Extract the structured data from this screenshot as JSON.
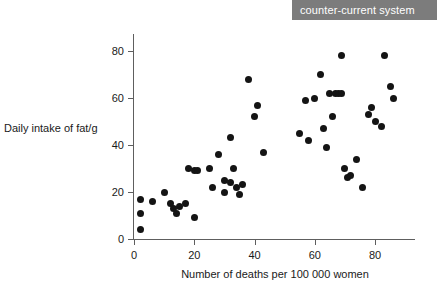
{
  "header": {
    "banner_label": "counter-current system",
    "banner_color": "#7c7c7c",
    "text_color": "#ffffff"
  },
  "chart_data": {
    "type": "scatter",
    "title": "",
    "xlabel": "Number of deaths per 100 000 women",
    "ylabel": "Daily intake of fat/g",
    "xlim": [
      0,
      90
    ],
    "ylim": [
      0,
      88
    ],
    "xticks": [
      0,
      20,
      40,
      60,
      80
    ],
    "yticks": [
      0,
      20,
      40,
      60,
      80
    ],
    "grid": false,
    "legend": null,
    "marker_color": "#141414",
    "axis_color": "#5e5e5e",
    "points": [
      {
        "x": 2,
        "y": 17
      },
      {
        "x": 2,
        "y": 11
      },
      {
        "x": 2,
        "y": 4
      },
      {
        "x": 6,
        "y": 16
      },
      {
        "x": 10,
        "y": 20
      },
      {
        "x": 12,
        "y": 15
      },
      {
        "x": 13,
        "y": 13
      },
      {
        "x": 15,
        "y": 14
      },
      {
        "x": 14,
        "y": 11
      },
      {
        "x": 17,
        "y": 15
      },
      {
        "x": 18,
        "y": 30
      },
      {
        "x": 20,
        "y": 29
      },
      {
        "x": 21,
        "y": 29
      },
      {
        "x": 20,
        "y": 9
      },
      {
        "x": 25,
        "y": 30
      },
      {
        "x": 26,
        "y": 22
      },
      {
        "x": 28,
        "y": 36
      },
      {
        "x": 30,
        "y": 25
      },
      {
        "x": 30,
        "y": 20
      },
      {
        "x": 32,
        "y": 43
      },
      {
        "x": 32,
        "y": 24
      },
      {
        "x": 33,
        "y": 30
      },
      {
        "x": 34,
        "y": 22
      },
      {
        "x": 35,
        "y": 19
      },
      {
        "x": 36,
        "y": 23
      },
      {
        "x": 38,
        "y": 68
      },
      {
        "x": 40,
        "y": 52
      },
      {
        "x": 41,
        "y": 57
      },
      {
        "x": 43,
        "y": 37
      },
      {
        "x": 55,
        "y": 45
      },
      {
        "x": 57,
        "y": 59
      },
      {
        "x": 58,
        "y": 42
      },
      {
        "x": 60,
        "y": 60
      },
      {
        "x": 62,
        "y": 70
      },
      {
        "x": 63,
        "y": 47
      },
      {
        "x": 64,
        "y": 39
      },
      {
        "x": 65,
        "y": 62
      },
      {
        "x": 66,
        "y": 52
      },
      {
        "x": 67,
        "y": 62
      },
      {
        "x": 68,
        "y": 62
      },
      {
        "x": 69,
        "y": 62
      },
      {
        "x": 69,
        "y": 78
      },
      {
        "x": 70,
        "y": 30
      },
      {
        "x": 71,
        "y": 26
      },
      {
        "x": 72,
        "y": 27
      },
      {
        "x": 74,
        "y": 34
      },
      {
        "x": 76,
        "y": 22
      },
      {
        "x": 78,
        "y": 53
      },
      {
        "x": 79,
        "y": 56
      },
      {
        "x": 80,
        "y": 50
      },
      {
        "x": 82,
        "y": 48
      },
      {
        "x": 83,
        "y": 78
      },
      {
        "x": 85,
        "y": 65
      },
      {
        "x": 86,
        "y": 60
      }
    ]
  }
}
